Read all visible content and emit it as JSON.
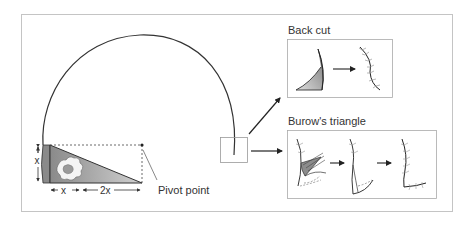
{
  "diagram": {
    "labels": {
      "pivot_point": "Pivot point",
      "dim_x_vertical": "x",
      "dim_x_horizontal": "x",
      "dim_2x": "2x"
    },
    "panels": [
      {
        "title": "Back cut",
        "steps": [
          "flap-with-shaded-back-cut",
          "sutured-result"
        ]
      },
      {
        "title": "Burow's triangle",
        "steps": [
          "flap-with-burow-triangle",
          "advanced-flap",
          "sutured-result"
        ]
      }
    ],
    "colors": {
      "line": "#333333",
      "frame": "#bdbdbd",
      "shade_dark": "#7a7a7a",
      "shade_light": "#d6d6d6",
      "suture": "#999999"
    }
  }
}
